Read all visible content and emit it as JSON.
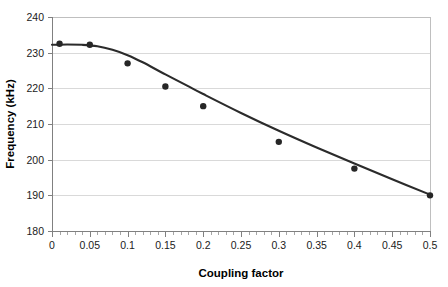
{
  "chart_data": {
    "type": "scatter",
    "title": "",
    "xlabel": "Coupling factor",
    "ylabel": "Frequency (kHz)",
    "xlim": [
      0,
      0.5
    ],
    "ylim": [
      180,
      240
    ],
    "grid": true,
    "legend": "none",
    "x_ticks": [
      "0",
      "0.05",
      "0.1",
      "0.15",
      "0.2",
      "0.25",
      "0.3",
      "0.35",
      "0.4",
      "0.45",
      "0.5"
    ],
    "x_tick_values": [
      0,
      0.05,
      0.1,
      0.15,
      0.2,
      0.25,
      0.3,
      0.35,
      0.4,
      0.45,
      0.5
    ],
    "y_ticks": [
      "180",
      "190",
      "200",
      "210",
      "220",
      "230",
      "240"
    ],
    "y_tick_values": [
      180,
      190,
      200,
      210,
      220,
      230,
      240
    ],
    "series": [
      {
        "name": "measured",
        "marker": "filled-circle",
        "color": "#262626",
        "x": [
          0.01,
          0.05,
          0.1,
          0.15,
          0.2,
          0.3,
          0.4,
          0.5
        ],
        "y": [
          232.5,
          232.2,
          227.0,
          220.5,
          215.0,
          205.0,
          197.5,
          190.0
        ]
      },
      {
        "name": "fitted curve",
        "marker": "none",
        "color": "#2b2b2b",
        "x": [
          0.0,
          0.02,
          0.04,
          0.06,
          0.08,
          0.1,
          0.12,
          0.15,
          0.18,
          0.2,
          0.25,
          0.3,
          0.35,
          0.4,
          0.45,
          0.5
        ],
        "y": [
          232.2,
          232.3,
          232.2,
          231.8,
          230.8,
          229.3,
          227.3,
          223.9,
          220.6,
          218.4,
          213.1,
          208.1,
          203.4,
          198.9,
          194.5,
          190.2
        ]
      }
    ]
  },
  "geometry": {
    "plot_left": 52,
    "plot_right": 430,
    "plot_top": 17,
    "plot_bottom": 231
  }
}
